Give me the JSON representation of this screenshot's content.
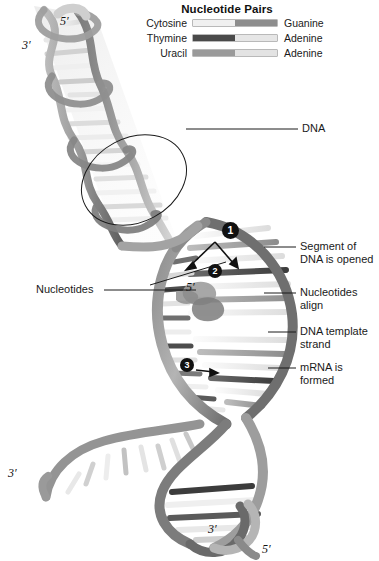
{
  "figure": {
    "title_block": {
      "title": "Nucleotide Pairs",
      "pairs": [
        {
          "left": "Cytosine",
          "right": "Guanine",
          "left_shade": "#f0f0f0",
          "right_shade": "#8d8d8d"
        },
        {
          "left": "Thymine",
          "right": "Adenine",
          "left_shade": "#4a4a4a",
          "right_shade": "#e6e6e6"
        },
        {
          "left": "Uracil",
          "right": "Adenine",
          "left_shade": "#9a9a9a",
          "right_shade": "#e3e3e3"
        }
      ]
    },
    "callouts": [
      {
        "id": "dna",
        "text": "DNA"
      },
      {
        "id": "segment-opened",
        "line1": "Segment of",
        "line2": "DNA is opened"
      },
      {
        "id": "nucleotides-align",
        "line1": "Nucleotides",
        "line2": "align"
      },
      {
        "id": "dna-template-strand",
        "line1": "DNA template",
        "line2": "strand"
      },
      {
        "id": "mrna-formed",
        "line1": "mRNA is",
        "line2": "formed"
      },
      {
        "id": "nucleotides",
        "text": "Nucleotides"
      }
    ],
    "steps": [
      {
        "number": "1"
      },
      {
        "number": "2"
      },
      {
        "number": "3"
      }
    ],
    "end_labels": [
      {
        "id": "top-five-prime",
        "text": "5′"
      },
      {
        "id": "top-three-prime",
        "text": "3′"
      },
      {
        "id": "inner-five-prime",
        "text": "5′"
      },
      {
        "id": "left-three-prime",
        "text": "3′"
      },
      {
        "id": "bottom-three-prime",
        "text": "3′"
      },
      {
        "id": "bottom-five-prime",
        "text": "5′"
      }
    ],
    "colors": {
      "background": "#ffffff",
      "ink": "#111111",
      "backbone_dark": "#6e6e6e",
      "backbone_light": "#c9c9c9",
      "base_light": "#ededed",
      "base_mid": "#a8a8a8",
      "base_dark": "#4f4f4f"
    }
  }
}
